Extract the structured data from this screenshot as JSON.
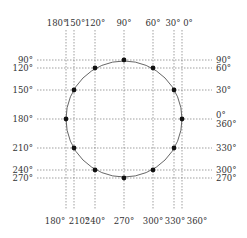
{
  "diagram": {
    "circle": {
      "cx": 124,
      "cy": 119,
      "r": 58,
      "stroke": "#555555"
    },
    "dot_color": "#111111",
    "grid_color": "#777777",
    "top_labels": [
      {
        "text": "180°",
        "x": 66
      },
      {
        "text": "150°",
        "x": 74
      },
      {
        "text": "120°",
        "x": 95
      },
      {
        "text": "90°",
        "x": 124
      },
      {
        "text": "60°",
        "x": 153
      },
      {
        "text": "30°",
        "x": 174
      },
      {
        "text": "0°",
        "x": 182
      }
    ],
    "bottom_labels": [
      {
        "text": "180°",
        "x": 66
      },
      {
        "text": "210°",
        "x": 74
      },
      {
        "text": "240°",
        "x": 95
      },
      {
        "text": "270°",
        "x": 124
      },
      {
        "text": "300°",
        "x": 153
      },
      {
        "text": "330°",
        "x": 174
      },
      {
        "text": "360°",
        "x": 182
      }
    ],
    "left_labels": [
      {
        "text": "90°",
        "y": 60
      },
      {
        "text": "120°",
        "y": 68
      },
      {
        "text": "150°",
        "y": 90
      },
      {
        "text": "180°",
        "y": 119
      },
      {
        "text": "210°",
        "y": 148
      },
      {
        "text": "240°",
        "y": 170
      },
      {
        "text": "270°",
        "y": 178
      }
    ],
    "right_labels": [
      {
        "text": "90°",
        "y": 60
      },
      {
        "text": "60°",
        "y": 68
      },
      {
        "text": "30°",
        "y": 90
      },
      {
        "text": "0°",
        "y": 115
      },
      {
        "text": "360°",
        "y": 124
      },
      {
        "text": "330°",
        "y": 148
      },
      {
        "text": "300°",
        "y": 170
      },
      {
        "text": "270°",
        "y": 178
      }
    ],
    "points": [
      {
        "angle": "0°",
        "x": 182,
        "y": 119
      },
      {
        "angle": "30°",
        "x": 174,
        "y": 90
      },
      {
        "angle": "60°",
        "x": 153,
        "y": 68
      },
      {
        "angle": "90°",
        "x": 124,
        "y": 60
      },
      {
        "angle": "120°",
        "x": 95,
        "y": 68
      },
      {
        "angle": "150°",
        "x": 74,
        "y": 90
      },
      {
        "angle": "180°",
        "x": 66,
        "y": 119
      },
      {
        "angle": "210°",
        "x": 74,
        "y": 148
      },
      {
        "angle": "240°",
        "x": 95,
        "y": 170
      },
      {
        "angle": "270°",
        "x": 124,
        "y": 178
      },
      {
        "angle": "300°",
        "x": 153,
        "y": 170
      },
      {
        "angle": "330°",
        "x": 174,
        "y": 148
      }
    ]
  }
}
